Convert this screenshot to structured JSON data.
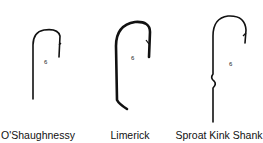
{
  "diagram": {
    "stroke_color": "#111111",
    "background": "#ffffff",
    "hooks": [
      {
        "name": "O'Shaughnessy",
        "size_label": "6",
        "label_x": 38
      },
      {
        "name": "Limerick",
        "size_label": "6",
        "label_x": 130
      },
      {
        "name": "Sproat Kink Shank",
        "size_label": "6",
        "label_x": 219
      }
    ]
  }
}
